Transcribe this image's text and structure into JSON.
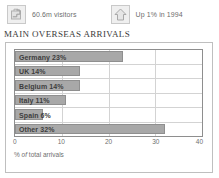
{
  "header": {
    "stats": [
      {
        "icon": "suitcase-icon",
        "text": "60.6m visitors"
      },
      {
        "icon": "up-arrow-icon",
        "text": "Up 1% in 1994"
      }
    ]
  },
  "chart_title": "MAIN OVERSEAS ARRIVALS",
  "colors": {
    "bar_fill": "#a8a8a8",
    "bar_stroke": "#8f8f8f",
    "grid": "#d3d3d3",
    "axis": "#8e8e8e",
    "frame": "#bfbfbf",
    "text": "#3d3d3d"
  },
  "chart_data": {
    "type": "bar",
    "orientation": "horizontal",
    "title": "MAIN OVERSEAS ARRIVALS",
    "xlabel": "% of total arrivals",
    "ylabel": "",
    "xlim": [
      0,
      40
    ],
    "xticks": [
      0,
      10,
      20,
      30,
      40
    ],
    "xtick_labels": [
      "0",
      "10",
      "20",
      "30",
      "40"
    ],
    "grid": "vertical",
    "legend": "none",
    "categories": [
      "Germany",
      "UK",
      "Belgium",
      "Italy",
      "Spain",
      "Other"
    ],
    "values": [
      23,
      14,
      14,
      11,
      6,
      32
    ],
    "data_labels": [
      "Germany 23%",
      "UK 14%",
      "Belgium 14%",
      "Italy 11%",
      "Spain 6%",
      "Other 32%"
    ]
  },
  "axis_caption": {
    "prefix": "% ",
    "italic": "of",
    "suffix": " total arrivals"
  }
}
